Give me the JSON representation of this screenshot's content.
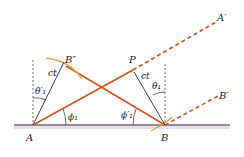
{
  "diagram": {
    "colors": {
      "ray": "#c8541e",
      "wavefront": "#e0a040",
      "radius": "#2a2a2a",
      "surface": "#7a6a78",
      "surface_shadow": "#d9d0dc",
      "guide": "#444444"
    },
    "labels": {
      "A": "A",
      "B": "B",
      "P": "P",
      "B_double_prime": "B″",
      "A_prime": "A′",
      "B_prime": "B′",
      "ct_left": "ct",
      "ct_right": "ct",
      "theta1_prime": "θ′₁",
      "theta1": "θ₁",
      "phi1": "ϕ₁",
      "phi1_prime": "ϕ′₁"
    }
  }
}
